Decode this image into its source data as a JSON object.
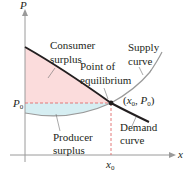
{
  "diagram": {
    "type": "supply-demand-equilibrium",
    "axes": {
      "y_label": "P",
      "x_label": "x"
    },
    "ticks": {
      "price": "P",
      "price_sub": "0",
      "quantity": "x",
      "quantity_sub": "0"
    },
    "labels": {
      "consumer_surplus_line1": "Consumer",
      "consumer_surplus_line2": "surplus",
      "producer_surplus_line1": "Producer",
      "producer_surplus_line2": "surplus",
      "equilibrium_line1": "Point of",
      "equilibrium_line2": "equilibrium",
      "supply_line1": "Supply",
      "supply_line2": "curve",
      "demand_line1": "Demand",
      "demand_line2": "curve",
      "point_open": "(",
      "point_x": "x",
      "point_x_sub": "0",
      "point_sep": ", ",
      "point_p": "P",
      "point_p_sub": "0",
      "point_close": ")"
    },
    "colors": {
      "consumer_surplus_fill": "#fbdcdc",
      "producer_surplus_fill": "#d6eef2",
      "demand_curve": "#231f20",
      "supply_curve": "#9a9a9a",
      "dashed_guides": "#e06b6b",
      "axes": "#9a9a9a",
      "text": "#231f20"
    }
  }
}
